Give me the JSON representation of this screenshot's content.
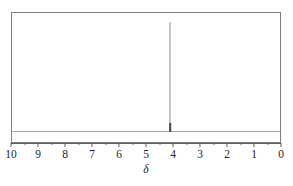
{
  "figure": {
    "background_color": "#ffffff",
    "frame_color": "#7e7e80",
    "baseline_color": "#aeaeb0",
    "peak_color": "#8e8e90",
    "axis_color": "#5f5f62",
    "label_color": "#1d1d1f"
  },
  "axis": {
    "title": "δ",
    "tick_labels": [
      "10",
      "9",
      "8",
      "7",
      "6",
      "5",
      "4",
      "3",
      "2",
      "1",
      "0"
    ],
    "minor_ticks_per_interval": 1,
    "direction": "reversed"
  },
  "chart_data": {
    "type": "line",
    "title": "",
    "subtitle": "",
    "xlabel": "δ",
    "ylabel": "",
    "xlim": [
      10,
      0
    ],
    "ylim": [
      0,
      1
    ],
    "grid": false,
    "legend": "none",
    "x_ticks": [
      10,
      9,
      8,
      7,
      6,
      5,
      4,
      3,
      2,
      1,
      0
    ],
    "x_tick_labels": [
      "10",
      "9",
      "8",
      "7",
      "6",
      "5",
      "4",
      "3",
      "2",
      "1",
      "0"
    ],
    "series": [
      {
        "name": "1H NMR spectrum",
        "peaks": [
          {
            "shift": 4.15,
            "relative_height": 0.93,
            "width": 0.04,
            "label": ""
          }
        ],
        "baseline_level": 0.0
      }
    ],
    "annotations": []
  }
}
